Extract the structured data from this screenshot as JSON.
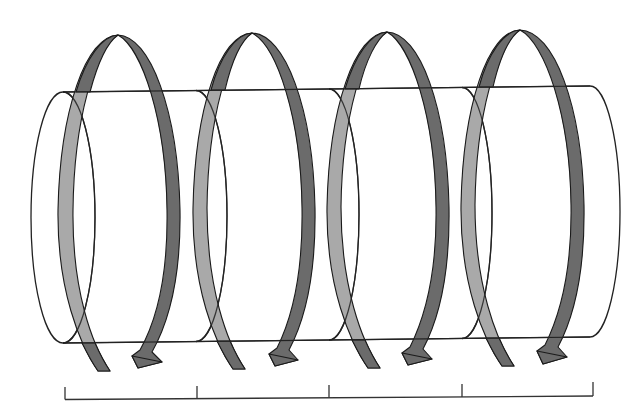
{
  "diagram": {
    "title": "Helical coil wrapped around a segmented cylinder",
    "colors": {
      "background": "#ffffff",
      "outline": "#222222",
      "band_front": "#6b6b6b",
      "band_back": "#a9a9a9"
    },
    "cylinder": {
      "segments": 4,
      "left_end": {
        "cx": 63,
        "cy": 217,
        "rx": 32,
        "ry": 125
      },
      "right_end": {
        "cx": 590,
        "cy": 212,
        "rx": 30,
        "ry": 125
      }
    },
    "coil_turns": [
      {
        "index": 1,
        "apex_x": 118,
        "arrow_tip": [
          138,
          368
        ]
      },
      {
        "index": 2,
        "apex_x": 252,
        "arrow_tip": [
          275,
          366
        ]
      },
      {
        "index": 3,
        "apex_x": 387,
        "arrow_tip": [
          408,
          365
        ]
      },
      {
        "index": 4,
        "apex_x": 520,
        "arrow_tip": [
          543,
          364
        ]
      }
    ],
    "scale_bar": {
      "tick_x": [
        65,
        197,
        329,
        462,
        593
      ],
      "intervals": 4
    }
  }
}
